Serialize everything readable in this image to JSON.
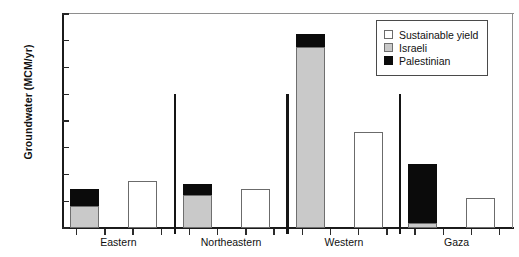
{
  "chart_data": {
    "type": "bar",
    "title": "",
    "subtitle": "",
    "xlabel": "",
    "ylabel": "Groundwater (MCM/yr)",
    "ylim": [
      0,
      400
    ],
    "ytick_values": [
      0,
      50,
      100,
      150,
      200,
      250,
      300,
      350,
      400
    ],
    "ytick_labels": [
      "0",
      "50",
      "100",
      "150",
      "200",
      "250",
      "300",
      "350",
      "400"
    ],
    "grid": false,
    "legend_position": "top-right",
    "stacked": true,
    "categories": [
      "Eastern",
      "Northeastern",
      "Western",
      "Gaza"
    ],
    "series": [
      {
        "name": "Palestinian",
        "color": "#0b0b0b",
        "values": [
          30,
          20,
          25,
          110
        ]
      },
      {
        "name": "Israeli",
        "color": "#c9c9c9",
        "values": [
          42,
          62,
          338,
          10
        ]
      },
      {
        "name": "Sustainable yield",
        "color": "#ffffff",
        "values": [
          88,
          73,
          180,
          57
        ]
      }
    ],
    "group_totals_abstraction": [
      72,
      82,
      363,
      120
    ]
  },
  "legend": {
    "items": [
      {
        "label": "Sustainable yield",
        "swatch": "white-square-icon"
      },
      {
        "label": "Israeli",
        "swatch": "gray-square-icon"
      },
      {
        "label": "Palestinian",
        "swatch": "black-square-icon"
      }
    ]
  }
}
